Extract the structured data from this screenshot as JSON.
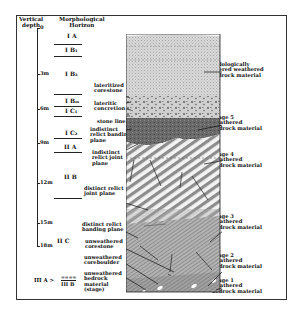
{
  "headers": {
    "depth": "Vertical depth",
    "depth_line1": "Vertical",
    "depth_line2": "depth",
    "horizon_line1": "Morphological",
    "horizon_line2": "Horizon"
  },
  "depth_ticks": [
    {
      "label": "0",
      "y": 4
    },
    {
      "label": "3m",
      "y": 58
    },
    {
      "label": "6m",
      "y": 93
    },
    {
      "label": "9m",
      "y": 127
    },
    {
      "label": "12m",
      "y": 167
    },
    {
      "label": "15m",
      "y": 207
    },
    {
      "label": "18m",
      "y": 244
    }
  ],
  "horizons": [
    {
      "label": "I A"
    },
    {
      "label": "I B1"
    },
    {
      "label": "I B2"
    },
    {
      "label": "I Bm"
    },
    {
      "label": "I C1"
    },
    {
      "label": "I C2"
    },
    {
      "label": "II A"
    },
    {
      "label": "II B"
    },
    {
      "label": "II C"
    },
    {
      "label": "III A > III B"
    }
  ],
  "horizon_text": {
    "IA": "I A",
    "IB1": "I B₁",
    "IB2": "I B₂",
    "IBm": "I Bₘ",
    "IC1": "I C₁",
    "IC2": "I C₂",
    "IIA": "II A",
    "IIB": "II B",
    "IIC": "II C",
    "IIIA": "III A >",
    "IIIA_num": "====",
    "IIIB": "III B"
  },
  "left_labels": {
    "lateritized_corestone_1": "lateritized",
    "lateritized_corestone_2": "corestone",
    "lateritic_concretion_1": "lateritic",
    "lateritic_concretion_2": "concretion",
    "stone_line": "stone line",
    "indistinct_banding_1": "indistinct",
    "indistinct_banding_2": "relict banding",
    "indistinct_banding_3": "plane",
    "indistinct_joint_1": "indistinct",
    "indistinct_joint_2": "relict joint",
    "indistinct_joint_3": "plane",
    "distinct_joint_1": "distinct relict",
    "distinct_joint_2": "joint plane",
    "distinct_banding_1": "distinct relict",
    "distinct_banding_2": "banding plane",
    "unweathered_corestone_1": "unweathered",
    "unweathered_corestone_2": "corestone",
    "unweathered_coreboulder_1": "unweathered",
    "unweathered_coreboulder_2": "coreboulder",
    "unweathered_bedrock_1": "unweathered",
    "unweathered_bedrock_2": "bedrock",
    "unweathered_bedrock_3": "material",
    "unweathered_bedrock_4": "(stage)"
  },
  "right_labels": {
    "pedo_1": "pedologically",
    "pedo_2": "altered weathered",
    "pedo_3": "bedrock material",
    "s5_1": "Stage 5",
    "s5_2": "weathered",
    "s5_3": "bedrock material",
    "s4_1": "Stage 4",
    "s4_2": "weathered",
    "s4_3": "bedrock material",
    "s3_1": "Stage 3",
    "s3_2": "weathered",
    "s3_3": "bedrock material",
    "s2_1": "Stage 2",
    "s2_2": "weathered",
    "s2_3": "bedrock material",
    "s1_1": "Stage 1",
    "s1_2": "weathered",
    "s1_3": "bedrock material"
  },
  "colors": {
    "line": "#222222",
    "soil_top": "#d6d6d6",
    "concretion": "#c9c9c9",
    "stage5": "#6e6e6e",
    "stage4_light": "#f2f2f2",
    "stage4_dark": "#8a8a8a",
    "stage3": "#a8a8a8",
    "bedrock": "#9c9c9c"
  }
}
